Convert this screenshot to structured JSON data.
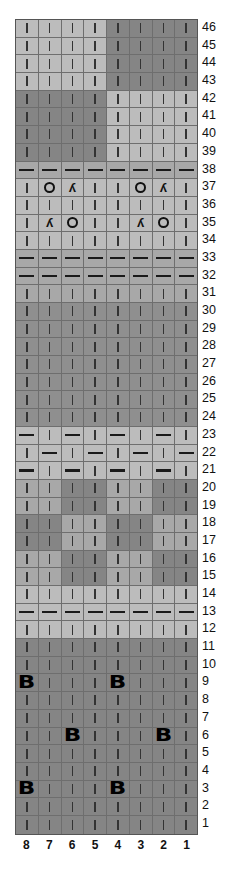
{
  "chart": {
    "title": "",
    "num_columns": 8,
    "num_rows": 46,
    "column_labels": [
      "8",
      "7",
      "6",
      "5",
      "4",
      "3",
      "2",
      "1"
    ],
    "row_labels": [
      "46",
      "45",
      "44",
      "43",
      "42",
      "41",
      "40",
      "39",
      "38",
      "37",
      "36",
      "35",
      "34",
      "33",
      "32",
      "31",
      "30",
      "29",
      "28",
      "27",
      "26",
      "25",
      "24",
      "23",
      "22",
      "21",
      "20",
      "19",
      "18",
      "17",
      "16",
      "15",
      "14",
      "13",
      "12",
      "11",
      "10",
      "9",
      "8",
      "7",
      "6",
      "5",
      "4",
      "3",
      "2",
      "1"
    ],
    "legend_symbols": {
      "|": "knit",
      "-": "purl",
      "O": "yarn over",
      "Y": "decrease",
      "B": "bobble"
    },
    "colors": {
      "L": "#bcbcbc",
      "M": "#a8a8a8",
      "D": "#858585",
      "D2": "#8f8f8f"
    },
    "rows": [
      {
        "n": "46",
        "shades": [
          "L",
          "L",
          "L",
          "L",
          "D",
          "D",
          "D",
          "D"
        ],
        "cells": [
          "|",
          "|",
          "|",
          "|",
          "|",
          "|",
          "|",
          "|"
        ]
      },
      {
        "n": "45",
        "shades": [
          "L",
          "L",
          "L",
          "L",
          "D",
          "D",
          "D",
          "D"
        ],
        "cells": [
          "|",
          "|",
          "|",
          "|",
          "|",
          "|",
          "|",
          "|"
        ]
      },
      {
        "n": "44",
        "shades": [
          "L",
          "L",
          "L",
          "L",
          "D",
          "D",
          "D",
          "D"
        ],
        "cells": [
          "|",
          "|",
          "|",
          "|",
          "|",
          "|",
          "|",
          "|"
        ]
      },
      {
        "n": "43",
        "shades": [
          "L",
          "L",
          "L",
          "L",
          "D",
          "D",
          "D",
          "D"
        ],
        "cells": [
          "|",
          "|",
          "|",
          "|",
          "|",
          "|",
          "|",
          "|"
        ]
      },
      {
        "n": "42",
        "shades": [
          "D",
          "D",
          "D",
          "D",
          "L",
          "L",
          "L",
          "L"
        ],
        "cells": [
          "|",
          "|",
          "|",
          "|",
          "|",
          "|",
          "|",
          "|"
        ]
      },
      {
        "n": "41",
        "shades": [
          "D",
          "D",
          "D",
          "D",
          "L",
          "L",
          "L",
          "L"
        ],
        "cells": [
          "|",
          "|",
          "|",
          "|",
          "|",
          "|",
          "|",
          "|"
        ]
      },
      {
        "n": "40",
        "shades": [
          "D",
          "D",
          "D",
          "D",
          "L",
          "L",
          "L",
          "L"
        ],
        "cells": [
          "|",
          "|",
          "|",
          "|",
          "|",
          "|",
          "|",
          "|"
        ]
      },
      {
        "n": "39",
        "shades": [
          "D",
          "D",
          "D",
          "D",
          "L",
          "L",
          "L",
          "L"
        ],
        "cells": [
          "|",
          "|",
          "|",
          "|",
          "|",
          "|",
          "|",
          "|"
        ]
      },
      {
        "n": "38",
        "shades": [
          "M",
          "M",
          "M",
          "M",
          "M",
          "M",
          "M",
          "M"
        ],
        "cells": [
          "-",
          "-",
          "-",
          "-",
          "-",
          "-",
          "-",
          "-"
        ]
      },
      {
        "n": "37",
        "shades": [
          "L",
          "L",
          "L",
          "L",
          "L",
          "L",
          "L",
          "L"
        ],
        "cells": [
          "|",
          "O",
          "Y",
          "|",
          "|",
          "O",
          "Y",
          "|"
        ]
      },
      {
        "n": "36",
        "shades": [
          "L",
          "L",
          "L",
          "L",
          "L",
          "L",
          "L",
          "L"
        ],
        "cells": [
          "|",
          "|",
          "|",
          "|",
          "|",
          "|",
          "|",
          "|"
        ]
      },
      {
        "n": "35",
        "shades": [
          "L",
          "L",
          "L",
          "L",
          "L",
          "L",
          "L",
          "L"
        ],
        "cells": [
          "|",
          "Y",
          "O",
          "|",
          "|",
          "Y",
          "O",
          "|"
        ]
      },
      {
        "n": "34",
        "shades": [
          "L",
          "L",
          "L",
          "L",
          "L",
          "L",
          "L",
          "L"
        ],
        "cells": [
          "|",
          "|",
          "|",
          "|",
          "|",
          "|",
          "|",
          "|"
        ]
      },
      {
        "n": "33",
        "shades": [
          "M",
          "M",
          "M",
          "M",
          "M",
          "M",
          "M",
          "M"
        ],
        "cells": [
          "-",
          "-",
          "-",
          "-",
          "-",
          "-",
          "-",
          "-"
        ]
      },
      {
        "n": "32",
        "shades": [
          "M",
          "M",
          "M",
          "M",
          "M",
          "M",
          "M",
          "M"
        ],
        "cells": [
          "-",
          "-",
          "-",
          "-",
          "-",
          "-",
          "-",
          "-"
        ]
      },
      {
        "n": "31",
        "shades": [
          "M",
          "M",
          "M",
          "M",
          "M",
          "M",
          "M",
          "M"
        ],
        "cells": [
          "|",
          "|",
          "|",
          "|",
          "|",
          "|",
          "|",
          "|"
        ]
      },
      {
        "n": "30",
        "shades": [
          "D2",
          "D2",
          "D2",
          "D2",
          "D2",
          "D2",
          "D2",
          "D2"
        ],
        "cells": [
          "|",
          "|",
          "|",
          "|",
          "|",
          "|",
          "|",
          "|"
        ]
      },
      {
        "n": "29",
        "shades": [
          "D2",
          "D2",
          "D2",
          "D2",
          "D2",
          "D2",
          "D2",
          "D2"
        ],
        "cells": [
          "|",
          "|",
          "|",
          "|",
          "|",
          "|",
          "|",
          "|"
        ]
      },
      {
        "n": "28",
        "shades": [
          "D2",
          "D2",
          "D2",
          "D2",
          "D2",
          "D2",
          "D2",
          "D2"
        ],
        "cells": [
          "|",
          "|",
          "|",
          "|",
          "|",
          "|",
          "|",
          "|"
        ]
      },
      {
        "n": "27",
        "shades": [
          "D2",
          "D2",
          "D2",
          "D2",
          "D2",
          "D2",
          "D2",
          "D2"
        ],
        "cells": [
          "|",
          "|",
          "|",
          "|",
          "|",
          "|",
          "|",
          "|"
        ]
      },
      {
        "n": "26",
        "shades": [
          "D2",
          "D2",
          "D2",
          "D2",
          "D2",
          "D2",
          "D2",
          "D2"
        ],
        "cells": [
          "|",
          "|",
          "|",
          "|",
          "|",
          "|",
          "|",
          "|"
        ]
      },
      {
        "n": "25",
        "shades": [
          "D2",
          "D2",
          "D2",
          "D2",
          "D2",
          "D2",
          "D2",
          "D2"
        ],
        "cells": [
          "|",
          "|",
          "|",
          "|",
          "|",
          "|",
          "|",
          "|"
        ]
      },
      {
        "n": "24",
        "shades": [
          "D2",
          "D2",
          "D2",
          "D2",
          "D2",
          "D2",
          "D2",
          "D2"
        ],
        "cells": [
          "|",
          "|",
          "|",
          "|",
          "|",
          "|",
          "|",
          "|"
        ]
      },
      {
        "n": "23",
        "shades": [
          "L",
          "L",
          "L",
          "L",
          "L",
          "L",
          "L",
          "L"
        ],
        "cells": [
          "-",
          "|",
          "-",
          "|",
          "-",
          "|",
          "-",
          "|"
        ]
      },
      {
        "n": "22",
        "shades": [
          "L",
          "L",
          "L",
          "L",
          "L",
          "L",
          "L",
          "L"
        ],
        "cells": [
          "|",
          "-",
          "|",
          "-",
          "|",
          "-",
          "|",
          "-"
        ]
      },
      {
        "n": "21",
        "shades": [
          "L",
          "L",
          "L",
          "L",
          "L",
          "L",
          "L",
          "L"
        ],
        "cells": [
          "-",
          "|",
          "-",
          "|",
          "-",
          "|",
          "-",
          "|"
        ]
      },
      {
        "n": "20",
        "shades": [
          "M",
          "M",
          "D",
          "D",
          "M",
          "M",
          "D",
          "D"
        ],
        "cells": [
          "|",
          "|",
          "|",
          "|",
          "|",
          "|",
          "|",
          "|"
        ]
      },
      {
        "n": "19",
        "shades": [
          "M",
          "M",
          "D",
          "D",
          "M",
          "M",
          "D",
          "D"
        ],
        "cells": [
          "|",
          "|",
          "|",
          "|",
          "|",
          "|",
          "|",
          "|"
        ]
      },
      {
        "n": "18",
        "shades": [
          "D",
          "D",
          "M",
          "M",
          "D",
          "D",
          "M",
          "M"
        ],
        "cells": [
          "|",
          "|",
          "|",
          "|",
          "|",
          "|",
          "|",
          "|"
        ]
      },
      {
        "n": "17",
        "shades": [
          "D",
          "D",
          "M",
          "M",
          "D",
          "D",
          "M",
          "M"
        ],
        "cells": [
          "|",
          "|",
          "|",
          "|",
          "|",
          "|",
          "|",
          "|"
        ]
      },
      {
        "n": "16",
        "shades": [
          "M",
          "M",
          "D",
          "D",
          "M",
          "M",
          "D",
          "D"
        ],
        "cells": [
          "|",
          "|",
          "|",
          "|",
          "|",
          "|",
          "|",
          "|"
        ]
      },
      {
        "n": "15",
        "shades": [
          "M",
          "M",
          "D",
          "D",
          "M",
          "M",
          "D",
          "D"
        ],
        "cells": [
          "|",
          "|",
          "|",
          "|",
          "|",
          "|",
          "|",
          "|"
        ]
      },
      {
        "n": "14",
        "shades": [
          "L",
          "L",
          "L",
          "L",
          "L",
          "L",
          "L",
          "L"
        ],
        "cells": [
          "|",
          "|",
          "|",
          "|",
          "|",
          "|",
          "|",
          "|"
        ]
      },
      {
        "n": "13",
        "shades": [
          "L",
          "L",
          "L",
          "L",
          "L",
          "L",
          "L",
          "L"
        ],
        "cells": [
          "-",
          "-",
          "-",
          "-",
          "-",
          "-",
          "-",
          "-"
        ]
      },
      {
        "n": "12",
        "shades": [
          "L",
          "L",
          "L",
          "L",
          "L",
          "L",
          "L",
          "L"
        ],
        "cells": [
          "|",
          "|",
          "|",
          "|",
          "|",
          "|",
          "|",
          "|"
        ]
      },
      {
        "n": "11",
        "shades": [
          "D",
          "D",
          "D",
          "D",
          "D",
          "D",
          "D",
          "D"
        ],
        "cells": [
          "|",
          "|",
          "|",
          "|",
          "|",
          "|",
          "|",
          "|"
        ]
      },
      {
        "n": "10",
        "shades": [
          "D",
          "D",
          "D",
          "D",
          "D",
          "D",
          "D",
          "D"
        ],
        "cells": [
          "|",
          "|",
          "|",
          "|",
          "|",
          "|",
          "|",
          "|"
        ]
      },
      {
        "n": "9",
        "shades": [
          "D",
          "D",
          "D",
          "D",
          "D",
          "D",
          "D",
          "D"
        ],
        "cells": [
          "B",
          "|",
          "|",
          "|",
          "B",
          "|",
          "|",
          "|"
        ]
      },
      {
        "n": "8",
        "shades": [
          "D",
          "D",
          "D",
          "D",
          "D",
          "D",
          "D",
          "D"
        ],
        "cells": [
          "|",
          "|",
          "|",
          "|",
          "|",
          "|",
          "|",
          "|"
        ]
      },
      {
        "n": "7",
        "shades": [
          "D",
          "D",
          "D",
          "D",
          "D",
          "D",
          "D",
          "D"
        ],
        "cells": [
          "|",
          "|",
          "|",
          "|",
          "|",
          "|",
          "|",
          "|"
        ]
      },
      {
        "n": "6",
        "shades": [
          "D",
          "D",
          "D",
          "D",
          "D",
          "D",
          "D",
          "D"
        ],
        "cells": [
          "|",
          "|",
          "B",
          "|",
          "|",
          "|",
          "B",
          "|"
        ]
      },
      {
        "n": "5",
        "shades": [
          "D",
          "D",
          "D",
          "D",
          "D",
          "D",
          "D",
          "D"
        ],
        "cells": [
          "|",
          "|",
          "|",
          "|",
          "|",
          "|",
          "|",
          "|"
        ]
      },
      {
        "n": "4",
        "shades": [
          "D",
          "D",
          "D",
          "D",
          "D",
          "D",
          "D",
          "D"
        ],
        "cells": [
          "|",
          "|",
          "|",
          "|",
          "|",
          "|",
          "|",
          "|"
        ]
      },
      {
        "n": "3",
        "shades": [
          "D",
          "D",
          "D",
          "D",
          "D",
          "D",
          "D",
          "D"
        ],
        "cells": [
          "B",
          "|",
          "|",
          "|",
          "B",
          "|",
          "|",
          "|"
        ]
      },
      {
        "n": "2",
        "shades": [
          "D",
          "D",
          "D",
          "D",
          "D",
          "D",
          "D",
          "D"
        ],
        "cells": [
          "|",
          "|",
          "|",
          "|",
          "|",
          "|",
          "|",
          "|"
        ]
      },
      {
        "n": "1",
        "shades": [
          "D",
          "D",
          "D",
          "D",
          "D",
          "D",
          "D",
          "D"
        ],
        "cells": [
          "|",
          "|",
          "|",
          "|",
          "|",
          "|",
          "|",
          "|"
        ]
      }
    ]
  },
  "glyphs": {
    "Y": "ʎ",
    "B": "B"
  }
}
